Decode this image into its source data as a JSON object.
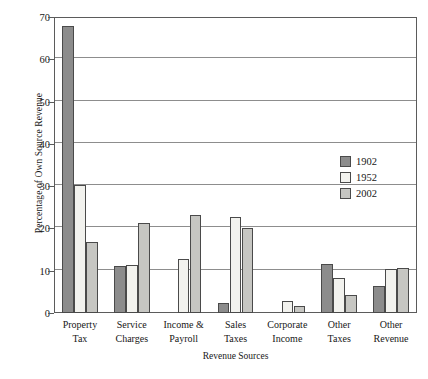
{
  "chart_data": {
    "type": "bar",
    "title": "",
    "xlabel": "Revenue Sources",
    "ylabel": "Percentage of Own Source Revenue",
    "categories": [
      "Property\nTax",
      "Service\nCharges",
      "Income &\nPayroll",
      "Sales\nTaxes",
      "Corporate\nIncome",
      "Other\nTaxes",
      "Other\nRevenue"
    ],
    "category_lines": [
      [
        "Property",
        "Tax"
      ],
      [
        "Service",
        "Charges"
      ],
      [
        "Income &",
        "Payroll"
      ],
      [
        "Sales",
        "Taxes"
      ],
      [
        "Corporate",
        "Income"
      ],
      [
        "Other",
        "Taxes"
      ],
      [
        "Other",
        "Revenue"
      ]
    ],
    "series": [
      {
        "name": "1902",
        "color": "#8c8c8c",
        "values": [
          67.8,
          11.2,
          0,
          2.3,
          0,
          11.6,
          6.5
        ]
      },
      {
        "name": "1952",
        "color": "#f2f2ee",
        "values": [
          30.3,
          11.3,
          12.7,
          22.8,
          2.8,
          8.2,
          10.4
        ]
      },
      {
        "name": "2002",
        "color": "#c6c6c2",
        "values": [
          16.8,
          21.4,
          23.2,
          20.1,
          1.7,
          4.3,
          10.6
        ]
      }
    ],
    "ylim": [
      0,
      70
    ],
    "yticks": [
      0,
      10,
      20,
      30,
      40,
      50,
      60,
      70
    ],
    "ytick_labels": [
      "0",
      "10",
      "20",
      "30",
      "40",
      "50",
      "60",
      "70"
    ],
    "grid": true,
    "legend_position": "right-middle"
  }
}
